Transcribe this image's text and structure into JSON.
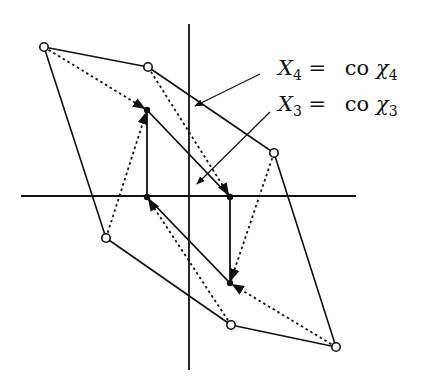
{
  "diagram": {
    "title": "",
    "colors": {
      "stroke": "#111111",
      "background": "#ffffff"
    },
    "axes": {
      "horizontal": {
        "x1": 21,
        "y1": 196,
        "x2": 356,
        "y2": 196
      },
      "vertical": {
        "x1": 189,
        "y1": 24,
        "x2": 189,
        "y2": 370
      }
    },
    "outer_polygon": {
      "style": "solid",
      "vertex_marker": "open-circle",
      "points": [
        [
          44,
          47
        ],
        [
          148,
          67
        ],
        [
          274,
          153
        ],
        [
          336,
          347
        ],
        [
          231,
          325
        ],
        [
          106,
          238
        ]
      ]
    },
    "inner_polygon": {
      "style": "solid",
      "vertex_marker": "filled-dot",
      "points": [
        [
          147,
          110
        ],
        [
          230,
          197
        ],
        [
          230,
          283
        ],
        [
          147,
          197
        ]
      ]
    },
    "dotted_arrows": [
      {
        "from": [
          44,
          47
        ],
        "to": [
          147,
          110
        ]
      },
      {
        "from": [
          148,
          67
        ],
        "to": [
          230,
          197
        ]
      },
      {
        "from": [
          274,
          153
        ],
        "to": [
          230,
          283
        ]
      },
      {
        "from": [
          336,
          347
        ],
        "to": [
          230,
          283
        ]
      },
      {
        "from": [
          231,
          325
        ],
        "to": [
          147,
          197
        ]
      },
      {
        "from": [
          106,
          238
        ],
        "to": [
          147,
          110
        ]
      }
    ],
    "leader_lines": [
      {
        "name": "X4",
        "from": [
          260,
          74
        ],
        "to": [
          195,
          106
        ]
      },
      {
        "name": "X3",
        "from": [
          270,
          112
        ],
        "to": [
          197,
          184
        ]
      }
    ],
    "labels": {
      "x4": {
        "var": "X",
        "var_sub": "4",
        "eq": "=",
        "op": "co",
        "chi": "χ",
        "chi_sub": "4"
      },
      "x3": {
        "var": "X",
        "var_sub": "3",
        "eq": "=",
        "op": "co",
        "chi": "χ",
        "chi_sub": "3"
      }
    }
  }
}
